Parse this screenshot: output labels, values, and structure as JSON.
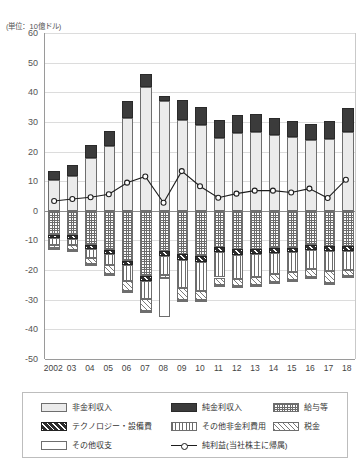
{
  "unit_label": "(単位：10億ドル)",
  "legend": {
    "items": [
      {
        "label": "非金利収入",
        "key": "nonint"
      },
      {
        "label": "純金利収入",
        "key": "netint"
      },
      {
        "label": "給与等",
        "key": "comp"
      },
      {
        "label": "テクノロジー・設備費",
        "key": "tech"
      },
      {
        "label": "その他非金利費用",
        "key": "othnon"
      },
      {
        "label": "税金",
        "key": "tax"
      },
      {
        "label": "その他収支",
        "key": "other"
      },
      {
        "label": "純利益(当社株主に帰属)",
        "key": "netincome"
      }
    ]
  },
  "chart_data": {
    "type": "bar",
    "title": "",
    "xlabel": "",
    "ylabel": "",
    "unit": "(単位：10億ドル)",
    "ylim": [
      -50,
      60
    ],
    "ytick_step": 10,
    "yticks": [
      60,
      50,
      40,
      30,
      20,
      10,
      0,
      -10,
      -20,
      -30,
      -40,
      -50
    ],
    "grid": true,
    "stacked": true,
    "legend_position": "bottom",
    "categories": [
      "2002",
      "03",
      "04",
      "05",
      "06",
      "07",
      "08",
      "09",
      "10",
      "11",
      "12",
      "13",
      "14",
      "15",
      "16",
      "17",
      "18"
    ],
    "series": [
      {
        "name": "非金利収入",
        "key": "nonint",
        "sign": "positive",
        "values": [
          10.3,
          11.9,
          17.8,
          21.8,
          31.2,
          41.8,
          37.0,
          30.6,
          29.0,
          24.5,
          26.2,
          26.6,
          25.6,
          24.8,
          24.0,
          24.4,
          26.6
        ]
      },
      {
        "name": "純金利収入",
        "key": "netint",
        "sign": "positive",
        "values": [
          3.3,
          3.4,
          4.4,
          5.3,
          5.7,
          4.2,
          1.8,
          6.7,
          6.1,
          6.0,
          6.2,
          6.0,
          5.6,
          5.4,
          5.4,
          6.0,
          8.0
        ]
      },
      {
        "name": "給与等",
        "key": "comp",
        "sign": "negative",
        "values": [
          -8.2,
          -8.3,
          -11.6,
          -13.3,
          -16.9,
          -22.0,
          -13.7,
          -14.7,
          -15.4,
          -12.2,
          -13.0,
          -13.0,
          -12.7,
          -12.4,
          -11.6,
          -12.0,
          -12.0
        ]
      },
      {
        "name": "テクノロジー・設備費",
        "key": "tech",
        "sign": "negative",
        "values": [
          -1.1,
          -1.1,
          -1.3,
          -1.4,
          -1.5,
          -1.6,
          -1.6,
          -1.8,
          -1.9,
          -1.8,
          -1.8,
          -1.7,
          -1.6,
          -1.6,
          -1.5,
          -1.6,
          -1.6
        ]
      },
      {
        "name": "その他非金利費用",
        "key": "othnon",
        "sign": "negative",
        "values": [
          -2.1,
          -2.2,
          -3.0,
          -3.6,
          -5.2,
          -6.2,
          -6.4,
          -9.4,
          -9.6,
          -8.5,
          -8.1,
          -7.6,
          -7.1,
          -6.8,
          -6.5,
          -6.6,
          -6.4
        ]
      },
      {
        "name": "税金",
        "key": "tax",
        "sign": "negative",
        "values": [
          -1.1,
          -1.5,
          -2.0,
          -2.9,
          -3.6,
          -4.1,
          -1.0,
          -4.2,
          -3.3,
          -2.4,
          -2.4,
          -2.6,
          -2.7,
          -2.4,
          -2.6,
          -4.0,
          -2.1
        ]
      },
      {
        "name": "その他収支",
        "key": "other",
        "sign": "negative",
        "values": [
          -0.4,
          -0.4,
          -0.5,
          -0.5,
          -0.6,
          -0.7,
          -13.2,
          -0.6,
          -0.6,
          -0.5,
          -0.5,
          -0.5,
          -0.5,
          -0.5,
          -0.5,
          -0.5,
          -0.5
        ]
      }
    ],
    "line_series": {
      "name": "純利益(当社株主に帰属)",
      "key": "netincome",
      "values": [
        3.3,
        4.0,
        4.6,
        5.6,
        9.5,
        11.6,
        2.7,
        13.4,
        8.3,
        4.4,
        5.8,
        6.8,
        6.8,
        6.2,
        7.5,
        4.3,
        10.5
      ],
      "marker": "circle-open",
      "color": "#1d1d1d"
    }
  }
}
